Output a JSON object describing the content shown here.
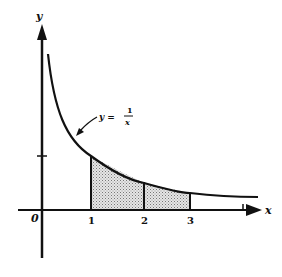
{
  "diagram": {
    "title": "",
    "axes": {
      "x_label": "x",
      "y_label": "y",
      "origin_label": "0",
      "x_ticks": [
        "1",
        "2",
        "3"
      ],
      "y_ticks": [
        "1"
      ]
    },
    "curve": {
      "equation_lhs": "y =",
      "numerator": "1",
      "denominator": "x"
    },
    "shaded_region": {
      "from_x": 1,
      "to_x": 3,
      "divisions_at": [
        1,
        2,
        3
      ],
      "fill": "dotted gray"
    },
    "colors": {
      "ink": "#111111",
      "shade": "#bdbdbd",
      "background": "#ffffff"
    }
  }
}
